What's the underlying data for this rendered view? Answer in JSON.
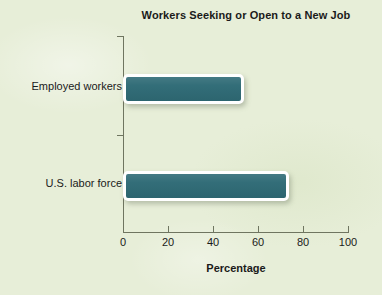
{
  "chart_data": {
    "type": "bar",
    "orientation": "horizontal",
    "title": "Workers Seeking or Open to a New Job",
    "xlabel": "Percentage",
    "ylabel": "",
    "categories": [
      "Employed workers",
      "U.S. labor force"
    ],
    "values": [
      51,
      71
    ],
    "xlim": [
      0,
      100
    ],
    "xticks": [
      0,
      20,
      40,
      60,
      80,
      100
    ],
    "xtick_labels": [
      "0",
      "20",
      "40",
      "60",
      "80",
      "100"
    ],
    "grid": false,
    "legend": "none",
    "bar_color": "#2f6b76",
    "bar_border_color": "#ffffff",
    "background_color": "#e7eed8",
    "axis_color": "#6f7560",
    "text_color": "#1a1a1a"
  }
}
